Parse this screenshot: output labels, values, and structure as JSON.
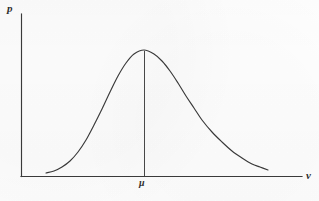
{
  "figure": {
    "kind": "gaussian-distribution-diagram",
    "background_color": "#fefefe",
    "line_color": "#3a3a3a"
  },
  "labels": {
    "y_axis": "p",
    "x_axis": "v",
    "mean": "μ"
  },
  "chart_data": {
    "type": "line",
    "title": "",
    "subtitle": "",
    "xlabel": "v",
    "ylabel": "p",
    "grid": false,
    "legend": null,
    "annotations": [
      {
        "name": "mean-marker",
        "label": "μ",
        "x": 144,
        "type": "vertical-line-from-axis-to-peak"
      }
    ],
    "axes": {
      "x_axis_pixel_y": 176,
      "y_axis_pixel_x": 21,
      "x_axis_pixel_range": [
        21,
        302
      ],
      "y_axis_pixel_range": [
        14,
        176
      ],
      "tick_labels_x": [
        "μ"
      ],
      "tick_labels_y": []
    },
    "series": [
      {
        "name": "probability-density",
        "points": [
          [
            46,
            173
          ],
          [
            54,
            171
          ],
          [
            62,
            167
          ],
          [
            70,
            161
          ],
          [
            78,
            152
          ],
          [
            86,
            140
          ],
          [
            94,
            125
          ],
          [
            102,
            109
          ],
          [
            110,
            92
          ],
          [
            118,
            76
          ],
          [
            126,
            63
          ],
          [
            134,
            54
          ],
          [
            144,
            50
          ],
          [
            154,
            54
          ],
          [
            162,
            61
          ],
          [
            170,
            71
          ],
          [
            178,
            83
          ],
          [
            186,
            96
          ],
          [
            194,
            108
          ],
          [
            202,
            120
          ],
          [
            212,
            132
          ],
          [
            222,
            142
          ],
          [
            232,
            151
          ],
          [
            242,
            158
          ],
          [
            252,
            164
          ],
          [
            260,
            167
          ],
          [
            268,
            170
          ]
        ]
      }
    ]
  }
}
